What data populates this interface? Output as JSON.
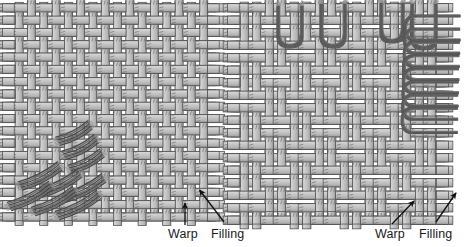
{
  "figure": {
    "background_color": "#ffffff",
    "panels": [
      {
        "id": "left-panel",
        "name": "plain-weave-panel",
        "weave_type": "plain weave",
        "x": 13,
        "y": 14,
        "width": 196,
        "height": 198,
        "columns": 16,
        "rows": 16,
        "pitch": 12.3,
        "tape_width": 8.2,
        "float_length": 1,
        "tow_overlay": {
          "style": "diagonal-bundles",
          "placement": "lower-left corner",
          "bundle_count": 9,
          "angle_deg": -27
        },
        "labels": [
          {
            "name": "warp-label-left",
            "text": "Warp",
            "x": 168,
            "y": 228,
            "arrow": {
              "from_x": 185,
              "from_y": 225,
              "to_x": 185,
              "to_y": 203,
              "style": "vertical"
            }
          },
          {
            "name": "filling-label-left",
            "text": "Filling",
            "x": 211,
            "y": 228,
            "arrow": {
              "from_x": 224,
              "from_y": 222,
              "to_x": 198,
              "to_y": 189,
              "style": "diagonal"
            }
          }
        ]
      },
      {
        "id": "right-panel",
        "name": "twill-weave-panel",
        "weave_type": "twill / float weave",
        "x": 238,
        "y": 14,
        "width": 200,
        "height": 198,
        "columns": 16,
        "rows": 16,
        "pitch": 12.5,
        "tape_width": 8.4,
        "float_length": 2,
        "tow_overlay": {
          "style": "u-loops",
          "placement": "top edge and right edge",
          "top_loop_count": 4,
          "right_loop_count": 8
        },
        "labels": [
          {
            "name": "warp-label-right",
            "text": "Warp",
            "x": 375,
            "y": 228,
            "arrow": {
              "from_x": 399,
              "from_y": 224,
              "to_x": 414,
              "to_y": 200,
              "style": "diagonal"
            }
          },
          {
            "name": "filling-label-right",
            "text": "Filling",
            "x": 419,
            "y": 228,
            "arrow": {
              "from_x": 437,
              "from_y": 222,
              "to_x": 456,
              "to_y": 192,
              "style": "diagonal"
            }
          }
        ]
      }
    ],
    "colors": {
      "tape_fill": "#bdbdbd",
      "tape_fill_light": "#d2d2d2",
      "tape_fill_shadow": "#9a9a9a",
      "tape_stroke": "#4f4f4f",
      "tow_dark": "#4a4a4a",
      "tow_mid": "#6e6e6e",
      "tow_light": "#8e8e8e",
      "label_text": "#1a1a1a",
      "arrow": "#111111",
      "background": "#ffffff"
    },
    "legend_terms": {
      "warp": "Warp",
      "filling": "Filling"
    }
  }
}
